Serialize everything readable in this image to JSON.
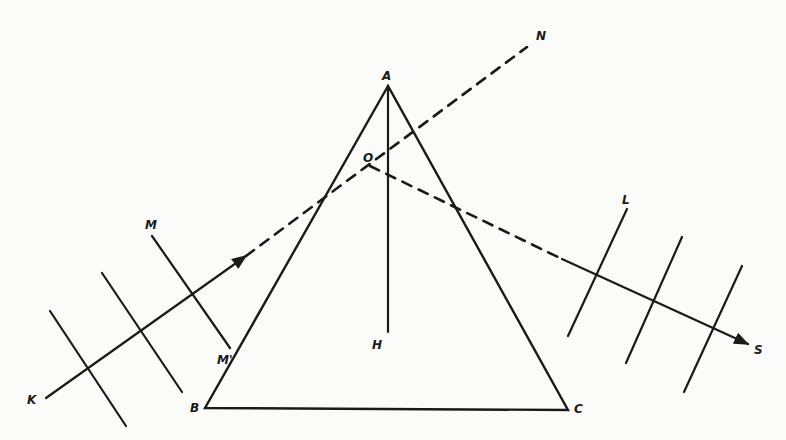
{
  "diagram": {
    "colors": {
      "ink": "#1a1a1a",
      "background": "#fbfbfa"
    },
    "prism": {
      "vertices": {
        "A": [
          388,
          86
        ],
        "B": [
          205,
          408
        ],
        "C": [
          568,
          410
        ]
      },
      "labels": {
        "A": "A",
        "B": "B",
        "C": "C"
      }
    },
    "axis": {
      "top": [
        388,
        86
      ],
      "bottom": [
        388,
        332
      ],
      "label": "H"
    },
    "point_O": {
      "pos": [
        370,
        166
      ],
      "label": "O"
    },
    "incident_ray": {
      "start": [
        46,
        398
      ],
      "arrow_tip": [
        246,
        256
      ],
      "label": "K"
    },
    "extension_dashed": {
      "start": [
        246,
        256
      ],
      "end": [
        527,
        47
      ],
      "label": "N"
    },
    "refracted_dashed": {
      "start": [
        370,
        166
      ],
      "end": [
        562,
        259
      ]
    },
    "emergent_ray": {
      "start": [
        562,
        259
      ],
      "end": [
        748,
        344
      ],
      "label": "S"
    },
    "incident_wavefronts": [
      {
        "p1": [
          50,
          311
        ],
        "p2": [
          126,
          426
        ]
      },
      {
        "p1": [
          102,
          273
        ],
        "p2": [
          182,
          392
        ]
      },
      {
        "p1": [
          152,
          236
        ],
        "p2": [
          230,
          348
        ],
        "label_top": "M",
        "label_bottom": "M'"
      }
    ],
    "emergent_wavefronts": [
      {
        "p1": [
          627,
          209
        ],
        "p2": [
          568,
          336
        ],
        "label_top": "L"
      },
      {
        "p1": [
          682,
          237
        ],
        "p2": [
          626,
          363
        ]
      },
      {
        "p1": [
          742,
          266
        ],
        "p2": [
          684,
          392
        ]
      }
    ],
    "labels": {
      "A": "A",
      "B": "B",
      "C": "C",
      "H": "H",
      "O": "O",
      "N": "N",
      "K": "K",
      "M": "M",
      "M_prime": "M'",
      "L": "L",
      "S": "S"
    }
  }
}
